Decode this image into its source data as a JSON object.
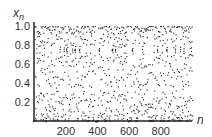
{
  "chart_data": {
    "type": "scatter",
    "title": "",
    "xlabel": "n",
    "ylabel": "x_n",
    "xlim": [
      0,
      1000
    ],
    "ylim": [
      0,
      1.0
    ],
    "xticks": [
      200,
      400,
      600,
      800
    ],
    "yticks": [
      0.2,
      0.4,
      0.6,
      0.8,
      1.0
    ],
    "ytick_labels": [
      "0.2",
      "0.4",
      "0.6",
      "0.8",
      "1.0"
    ],
    "xtick_labels": [
      "200",
      "400",
      "600",
      "800"
    ],
    "grid": false,
    "legend": null,
    "n_points": 1000,
    "marker_color": "#222222"
  },
  "axes": {
    "x_label": "n",
    "y_label_base": "x",
    "y_label_sub": "n"
  }
}
